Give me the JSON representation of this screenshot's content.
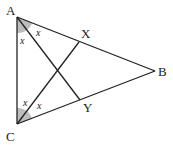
{
  "diagram": {
    "type": "geometry-triangle",
    "points": {
      "A": {
        "label": "A",
        "x": 17,
        "y": 17
      },
      "B": {
        "label": "B",
        "x": 155,
        "y": 71
      },
      "C": {
        "label": "C",
        "x": 17,
        "y": 124
      },
      "X": {
        "label": "X",
        "x": 79,
        "y": 42
      },
      "Y": {
        "label": "Y",
        "x": 80,
        "y": 100
      }
    },
    "segments": [
      {
        "from": "A",
        "to": "B"
      },
      {
        "from": "C",
        "to": "B"
      },
      {
        "from": "A",
        "to": "C"
      },
      {
        "from": "A",
        "to": "Y"
      },
      {
        "from": "C",
        "to": "X"
      }
    ],
    "angle_labels": {
      "A_upper": "x",
      "A_lower": "x",
      "C_upper": "x",
      "C_lower": "x"
    },
    "colors": {
      "line": "#222222",
      "shade": "#bdbdbd"
    }
  }
}
